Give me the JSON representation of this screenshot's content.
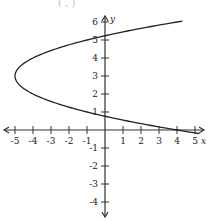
{
  "header_fragment": "( , )",
  "chart_data": {
    "type": "line",
    "title": "",
    "xlabel": "x",
    "ylabel": "y",
    "xlim": [
      -5.5,
      5.5
    ],
    "ylim": [
      -4.5,
      6.5
    ],
    "grid": false,
    "x_ticks": [
      -5,
      -4,
      -3,
      -2,
      -1,
      1,
      2,
      3,
      4,
      5
    ],
    "y_ticks": [
      -4,
      -3,
      -2,
      -1,
      1,
      2,
      3,
      4,
      5,
      6
    ],
    "series": [
      {
        "name": "parabola x = y^2 - 6y + 4",
        "equation": "x = y^2 - 6y + 4",
        "vertex": [
          -5,
          3
        ],
        "opens": "right",
        "y_intercepts": [
          0.76,
          5.24
        ],
        "points": [
          [
            5,
            -0.16
          ],
          [
            4,
            0
          ],
          [
            0,
            0.76
          ],
          [
            -3,
            1.59
          ],
          [
            -5,
            3
          ],
          [
            -3,
            4.41
          ],
          [
            0,
            5.24
          ],
          [
            4,
            6
          ]
        ]
      }
    ],
    "scale": {
      "origin_px": [
        105,
        130
      ],
      "px_per_unit": 18
    }
  }
}
